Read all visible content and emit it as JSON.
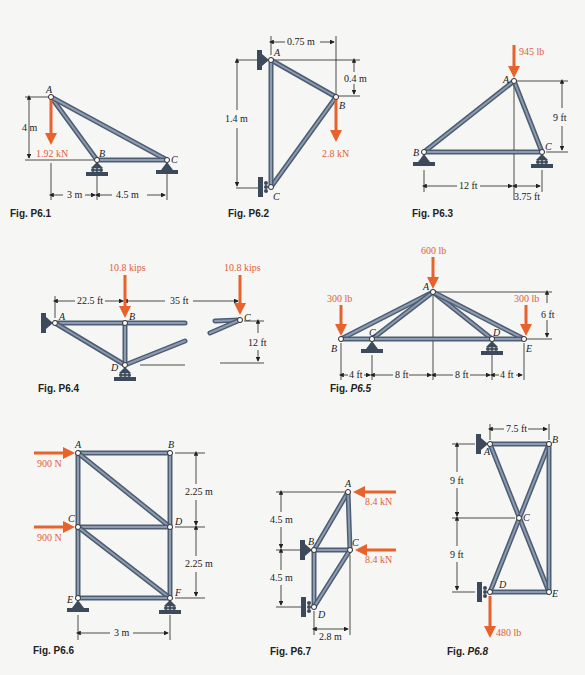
{
  "figures": [
    {
      "id": "P6.1",
      "caption": "Fig. P6.1",
      "nodes": [
        "A",
        "B",
        "C"
      ],
      "members": [
        [
          "A",
          "B"
        ],
        [
          "A",
          "C"
        ],
        [
          "B",
          "C"
        ]
      ],
      "loads": [
        {
          "node": "A",
          "label": "1.92 kN",
          "direction": "down"
        }
      ],
      "dimensions": {
        "vertical": "4 m",
        "horizontal": [
          "3 m",
          "4.5 m"
        ]
      },
      "supports": {
        "B": "roller",
        "C": "pin"
      }
    },
    {
      "id": "P6.2",
      "caption": "Fig. P6.2",
      "nodes": [
        "A",
        "B",
        "C"
      ],
      "members": [
        [
          "A",
          "B"
        ],
        [
          "B",
          "C"
        ],
        [
          "A",
          "C"
        ]
      ],
      "loads": [
        {
          "node": "B",
          "label": "2.8 kN",
          "direction": "down"
        }
      ],
      "dimensions": {
        "horizontal": "0.75 m",
        "vertical_small": "0.4 m",
        "vertical": "1.4 m"
      },
      "supports": {
        "A": "pin-wall",
        "C": "roller-wall"
      }
    },
    {
      "id": "P6.3",
      "caption": "Fig. P6.3",
      "nodes": [
        "A",
        "B",
        "C"
      ],
      "members": [
        [
          "A",
          "B"
        ],
        [
          "A",
          "C"
        ],
        [
          "B",
          "C"
        ]
      ],
      "loads": [
        {
          "node": "A",
          "label": "945 lb",
          "direction": "down"
        }
      ],
      "dimensions": {
        "vertical": "9 ft",
        "horizontal": [
          "12 ft",
          "3.75 ft"
        ]
      },
      "supports": {
        "B": "pin",
        "C": "roller"
      }
    },
    {
      "id": "P6.4",
      "caption": "Fig. P6.4",
      "nodes": [
        "A",
        "B",
        "C",
        "D"
      ],
      "members": [
        [
          "A",
          "B"
        ],
        [
          "B",
          "C"
        ],
        [
          "A",
          "D"
        ],
        [
          "B",
          "D"
        ],
        [
          "D",
          "C"
        ]
      ],
      "loads": [
        {
          "node": "B",
          "label": "10.8 kips",
          "direction": "down"
        },
        {
          "node": "C",
          "label": "10.8 kips",
          "direction": "down"
        }
      ],
      "dimensions": {
        "horizontal": [
          "22.5 ft",
          "35 ft"
        ],
        "vertical": "12 ft"
      },
      "supports": {
        "A": "pin-wall",
        "D": "roller"
      }
    },
    {
      "id": "P6.5",
      "caption_prefix": "Fig. ",
      "caption_italic": "P6.5",
      "nodes": [
        "A",
        "B",
        "C",
        "D",
        "E"
      ],
      "members": [
        [
          "A",
          "B"
        ],
        [
          "A",
          "C"
        ],
        [
          "A",
          "D"
        ],
        [
          "A",
          "E"
        ],
        [
          "B",
          "E"
        ]
      ],
      "loads": [
        {
          "node": "A",
          "label": "600 lb",
          "direction": "down"
        },
        {
          "node": "B",
          "label": "300 lb",
          "direction": "down"
        },
        {
          "node": "E",
          "label": "300 lb",
          "direction": "down"
        }
      ],
      "dimensions": {
        "vertical": "6 ft",
        "horizontal": [
          "4 ft",
          "8 ft",
          "8 ft",
          "4 ft"
        ]
      },
      "supports": {
        "C": "pin",
        "D": "roller"
      }
    },
    {
      "id": "P6.6",
      "caption": "Fig. P6.6",
      "nodes": [
        "A",
        "B",
        "C",
        "D",
        "E",
        "F"
      ],
      "members": [
        [
          "A",
          "B"
        ],
        [
          "A",
          "C"
        ],
        [
          "B",
          "D"
        ],
        [
          "A",
          "D"
        ],
        [
          "C",
          "D"
        ],
        [
          "C",
          "E"
        ],
        [
          "D",
          "F"
        ],
        [
          "C",
          "F"
        ],
        [
          "E",
          "F"
        ]
      ],
      "loads": [
        {
          "node": "A",
          "label": "900 N",
          "direction": "right"
        },
        {
          "node": "C",
          "label": "900 N",
          "direction": "right"
        }
      ],
      "dimensions": {
        "vertical": [
          "2.25 m",
          "2.25 m"
        ],
        "horizontal": "3 m"
      },
      "supports": {
        "E": "pin",
        "F": "roller"
      }
    },
    {
      "id": "P6.7",
      "caption": "Fig. P6.7",
      "nodes": [
        "A",
        "B",
        "C",
        "D"
      ],
      "members": [
        [
          "A",
          "B"
        ],
        [
          "A",
          "C"
        ],
        [
          "B",
          "C"
        ],
        [
          "B",
          "D"
        ],
        [
          "C",
          "D"
        ]
      ],
      "loads": [
        {
          "node": "A",
          "label": "8.4 kN",
          "direction": "left"
        },
        {
          "node": "C",
          "label": "8.4 kN",
          "direction": "left"
        }
      ],
      "dimensions": {
        "vertical": [
          "4.5 m",
          "4.5 m"
        ],
        "horizontal": "2.8 m"
      },
      "supports": {
        "B": "pin-wall",
        "D": "roller-wall"
      }
    },
    {
      "id": "P6.8",
      "caption_prefix": "Fig. ",
      "caption_italic": "P6.8",
      "nodes": [
        "A",
        "B",
        "C",
        "D",
        "E"
      ],
      "members": [
        [
          "A",
          "B"
        ],
        [
          "A",
          "E"
        ],
        [
          "B",
          "D"
        ],
        [
          "B",
          "E"
        ],
        [
          "D",
          "E"
        ]
      ],
      "loads": [
        {
          "node": "D",
          "label": "480 lb",
          "direction": "down"
        }
      ],
      "dimensions": {
        "horizontal": "7.5 ft",
        "vertical": [
          "9 ft",
          "9 ft"
        ]
      },
      "supports": {
        "A": "pin-wall",
        "D": "roller-wall"
      }
    }
  ],
  "colors": {
    "member": "#4d5d72",
    "member_highlight": "#8c9bb0",
    "force": "#e8622e",
    "support": "#3d4a5c",
    "background": "#f6f6f4"
  }
}
